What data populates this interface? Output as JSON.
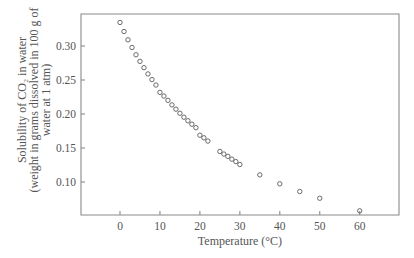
{
  "chart_data": {
    "type": "scatter",
    "title": "",
    "xlabel": "Temperature (°C)",
    "ylabel_lines": [
      "Solubility of CO₂ in water",
      "(weight in grams dissolved in 100 g of",
      "water at 1 atm)"
    ],
    "xlim": [
      -10,
      70
    ],
    "ylim": [
      0.05,
      0.34
    ],
    "xticks": [
      0,
      10,
      20,
      30,
      40,
      50,
      60
    ],
    "xtick_labels": [
      "0",
      "10",
      "20",
      "30",
      "40",
      "50",
      "60"
    ],
    "yticks": [
      0.1,
      0.15,
      0.2,
      0.25,
      0.3
    ],
    "ytick_labels": [
      "0.10",
      "0.15",
      "0.20",
      "0.25",
      "0.30"
    ],
    "grid": false,
    "legend": null,
    "marker": "open-circle",
    "series": [
      {
        "name": "CO2 solubility",
        "x": [
          0,
          1,
          2,
          3,
          4,
          5,
          6,
          7,
          8,
          9,
          10,
          11,
          12,
          13,
          14,
          15,
          16,
          17,
          18,
          19,
          20,
          21,
          22,
          25,
          26,
          27,
          28,
          29,
          30,
          35,
          40,
          45,
          50,
          60
        ],
        "y": [
          0.3346,
          0.3213,
          0.3091,
          0.2978,
          0.2871,
          0.2774,
          0.2681,
          0.2589,
          0.2506,
          0.2426,
          0.2318,
          0.2264,
          0.2201,
          0.2134,
          0.2071,
          0.2011,
          0.1953,
          0.1901,
          0.185,
          0.1799,
          0.1688,
          0.165,
          0.1602,
          0.1449,
          0.1411,
          0.1377,
          0.1336,
          0.13,
          0.1257,
          0.1105,
          0.0973,
          0.086,
          0.0761,
          0.0576
        ]
      }
    ]
  },
  "colors": {
    "axis": "#8a8a8a",
    "marker": "#6a6a6a",
    "text": "#555555"
  }
}
